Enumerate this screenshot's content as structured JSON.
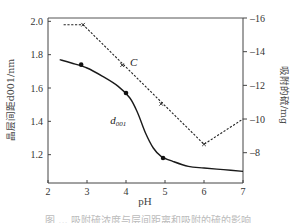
{
  "chart_data": {
    "type": "line",
    "title": "",
    "xlabel": "pH",
    "ylabel_left": "晶层间距d001/nm",
    "ylabel_right": "吸附的硫/mg",
    "xlim": [
      2,
      7
    ],
    "ylim_left": [
      1.03,
      2.02
    ],
    "ylim_right": [
      6.2,
      16
    ],
    "x_ticks": [
      "2",
      "3",
      "4",
      "5",
      "6",
      "7"
    ],
    "y_ticks_left": [
      "1.2",
      "1.4",
      "1.6",
      "1.8",
      "2.0"
    ],
    "y_ticks_right": [
      "8",
      "10",
      "12",
      "14",
      "16"
    ],
    "grid": false,
    "legend": "inline labels",
    "series": [
      {
        "name": "d001",
        "axis": "left",
        "style": "solid",
        "curve_x": [
          2.3,
          2.6,
          3.0,
          3.4,
          3.8,
          4.1,
          4.3,
          4.5,
          4.7,
          4.9,
          5.2,
          5.6,
          6.0,
          6.5,
          7.0
        ],
        "curve_y": [
          1.77,
          1.75,
          1.72,
          1.67,
          1.61,
          1.54,
          1.45,
          1.33,
          1.24,
          1.19,
          1.16,
          1.13,
          1.12,
          1.11,
          1.1
        ],
        "markers_x": [
          2.85,
          4.0,
          4.95
        ],
        "markers_y": [
          1.74,
          1.57,
          1.18
        ]
      },
      {
        "name": "C",
        "axis": "right",
        "style": "dashed",
        "x": [
          2.4,
          2.9,
          6.0,
          7.0
        ],
        "y": [
          15.6,
          15.6,
          8.5,
          10.0
        ],
        "markers_x": [
          3.9,
          4.9
        ],
        "markers_y": [
          13.2,
          10.9
        ]
      }
    ],
    "annotations": [
      {
        "text": "C",
        "x": 4.1,
        "y_right": 13.4
      },
      {
        "text": "d001",
        "x": 3.8,
        "y_left": 1.41
      }
    ]
  },
  "caption": "图 ... 吸附硫浓度与层间距离和吸附的硫的影响"
}
